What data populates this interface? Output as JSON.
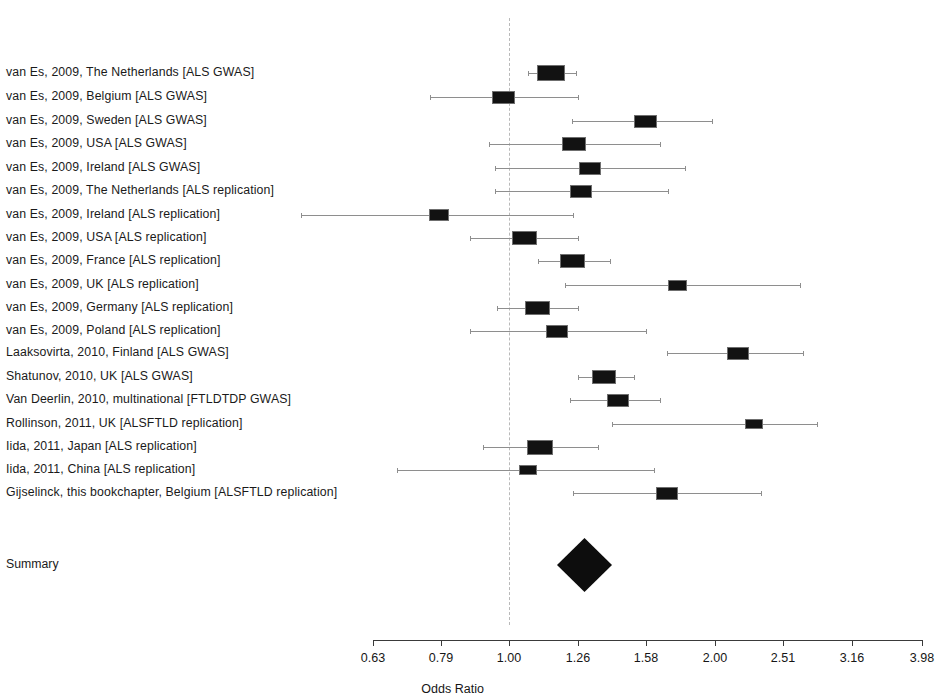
{
  "figure": {
    "type": "forest-plot",
    "background_color": "#ffffff",
    "marker_color": "#121212",
    "ci_color": "#8e8e8e",
    "refline_color": "#b9b9b9",
    "summary_label": "Summary"
  },
  "axis": {
    "title": "Odds Ratio",
    "scale": "log",
    "tick_labels": [
      "0.63",
      "0.79",
      "1.00",
      "1.26",
      "1.58",
      "2.00",
      "2.51",
      "3.16",
      "3.98"
    ],
    "tick_values": [
      0.63,
      0.79,
      1.0,
      1.26,
      1.58,
      2.0,
      2.51,
      3.16,
      3.98
    ],
    "tick_x": [
      373,
      441,
      509,
      578,
      646,
      715,
      783,
      852,
      922
    ],
    "reference_value": 1.0,
    "reference_x": 509
  },
  "chart_data": {
    "type": "forest",
    "title": "",
    "xlabel": "Odds Ratio",
    "ylabel": "",
    "xscale": "log",
    "xlim": [
      0.63,
      3.98
    ],
    "xticks": [
      0.63,
      0.79,
      1.0,
      1.26,
      1.58,
      2.0,
      2.51,
      3.16,
      3.98
    ],
    "reference_line": 1.0,
    "grid": false,
    "legend": "none",
    "rows": [
      {
        "label": "van Es, 2009, The Netherlands [ALS GWAS]",
        "or": 1.18,
        "ci_low": 1.09,
        "ci_high": 1.29,
        "y": 73,
        "x": 551,
        "ci_x0": 528,
        "ci_x1": 576,
        "box": 28
      },
      {
        "label": "van Es, 2009, Belgium [ALS GWAS]",
        "or": 0.98,
        "ci_low": 0.78,
        "ci_high": 1.26,
        "y": 97,
        "x": 503,
        "ci_x0": 430,
        "ci_x1": 578,
        "box": 23
      },
      {
        "label": "van Es, 2009, Sweden [ALS GWAS]",
        "or": 1.55,
        "ci_low": 1.23,
        "ci_high": 1.97,
        "y": 121,
        "x": 645,
        "ci_x0": 572,
        "ci_x1": 712,
        "box": 23
      },
      {
        "label": "van Es, 2009, USA [ALS GWAS]",
        "or": 1.25,
        "ci_low": 1.0,
        "ci_high": 1.58,
        "y": 144,
        "x": 574,
        "ci_x0": 489,
        "ci_x1": 660,
        "box": 24
      },
      {
        "label": "van Es, 2009, Ireland [ALS GWAS]",
        "or": 1.32,
        "ci_low": 1.0,
        "ci_high": 1.75,
        "y": 168,
        "x": 590,
        "ci_x0": 495,
        "ci_x1": 685,
        "box": 22
      },
      {
        "label": "van Es, 2009, The Netherlands [ALS replication]",
        "or": 1.28,
        "ci_low": 1.05,
        "ci_high": 1.57,
        "y": 191,
        "x": 581,
        "ci_x0": 495,
        "ci_x1": 668,
        "box": 22
      },
      {
        "label": "van Es, 2009, Ireland [ALS replication]",
        "or": 0.79,
        "ci_low": 0.52,
        "ci_high": 1.22,
        "y": 215,
        "x": 439,
        "ci_x0": 301,
        "ci_x1": 573,
        "box": 20
      },
      {
        "label": "van Es, 2009, USA [ALS replication]",
        "or": 1.06,
        "ci_low": 0.87,
        "ci_high": 1.29,
        "y": 238,
        "x": 524,
        "ci_x0": 470,
        "ci_x1": 578,
        "box": 25
      },
      {
        "label": "van Es, 2009, France [ALS replication]",
        "or": 1.24,
        "ci_low": 1.03,
        "ci_high": 1.47,
        "y": 261,
        "x": 572,
        "ci_x0": 538,
        "ci_x1": 610,
        "box": 25
      },
      {
        "label": "van Es, 2009, UK [ALS replication]",
        "or": 1.73,
        "ci_low": 1.25,
        "ci_high": 2.42,
        "y": 285,
        "x": 677,
        "ci_x0": 565,
        "ci_x1": 800,
        "box": 19
      },
      {
        "label": "van Es, 2009, Germany [ALS replication]",
        "or": 1.11,
        "ci_low": 0.92,
        "ci_high": 1.33,
        "y": 308,
        "x": 537,
        "ci_x0": 497,
        "ci_x1": 578,
        "box": 25
      },
      {
        "label": "van Es, 2009, Poland [ALS replication]",
        "or": 1.19,
        "ci_low": 0.9,
        "ci_high": 1.58,
        "y": 331,
        "x": 557,
        "ci_x0": 470,
        "ci_x1": 646,
        "box": 22
      },
      {
        "label": "Laaksovirta, 2010, Finland [ALS GWAS]",
        "or": 2.05,
        "ci_low": 1.62,
        "ci_high": 2.63,
        "y": 353,
        "x": 738,
        "ci_x0": 667,
        "ci_x1": 803,
        "box": 22
      },
      {
        "label": "Shatunov, 2010, UK [ALS GWAS]",
        "or": 1.37,
        "ci_low": 1.22,
        "ci_high": 1.53,
        "y": 377,
        "x": 604,
        "ci_x0": 578,
        "ci_x1": 634,
        "box": 24
      },
      {
        "label": "Van Deerlin, 2010, multinational [FTLDTDP GWAS]",
        "or": 1.42,
        "ci_low": 1.19,
        "ci_high": 1.66,
        "y": 400,
        "x": 618,
        "ci_x0": 570,
        "ci_x1": 660,
        "box": 22
      },
      {
        "label": "Rollinson, 2011, UK [ALSFTLD replication]",
        "or": 2.26,
        "ci_low": 1.43,
        "ci_high": 3.19,
        "y": 424,
        "x": 754,
        "ci_x0": 612,
        "ci_x1": 817,
        "box": 18
      },
      {
        "label": "Iida, 2011, Japan [ALS replication]",
        "or": 1.13,
        "ci_low": 0.87,
        "ci_high": 1.45,
        "y": 447,
        "x": 540,
        "ci_x0": 483,
        "ci_x1": 598,
        "box": 26
      },
      {
        "label": "Iida, 2011, China [ALS replication]",
        "or": 1.08,
        "ci_low": 0.71,
        "ci_high": 1.62,
        "y": 470,
        "x": 528,
        "ci_x0": 397,
        "ci_x1": 654,
        "box": 18
      },
      {
        "label": "Gijselinck, this bookchapter, Belgium [ALSFTLD replication]",
        "or": 1.68,
        "ci_low": 1.26,
        "ci_high": 2.23,
        "y": 493,
        "x": 667,
        "ci_x0": 573,
        "ci_x1": 761,
        "box": 22
      }
    ],
    "summary": {
      "label": "Summary",
      "or": 1.27,
      "ci_low": 1.17,
      "ci_high": 1.38,
      "y": 565,
      "x": 584,
      "left_x": 557,
      "right_x": 612,
      "half_height": 27
    }
  }
}
